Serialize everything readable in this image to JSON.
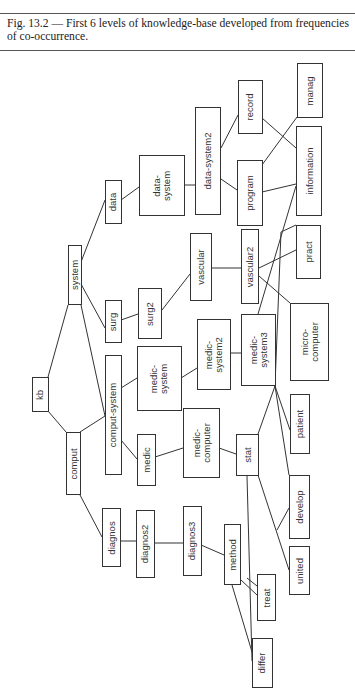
{
  "caption": {
    "text": "Fig. 13.2 — First 6 levels of knowledge-base developed from frequencies of co-occurrence."
  },
  "diagram": {
    "orientation": "rotated-90-ccw",
    "nodes": [
      {
        "id": "kb",
        "label": "kb",
        "x": 32,
        "y": 377,
        "w": 17,
        "h": 35
      },
      {
        "id": "comput",
        "label": "comput",
        "x": 66,
        "y": 432,
        "w": 15,
        "h": 63
      },
      {
        "id": "system",
        "label": "system",
        "x": 68,
        "y": 245,
        "w": 14,
        "h": 60
      },
      {
        "id": "data",
        "label": "data",
        "x": 105,
        "y": 180,
        "w": 17,
        "h": 44
      },
      {
        "id": "surg",
        "label": "surg",
        "x": 105,
        "y": 300,
        "w": 17,
        "h": 43
      },
      {
        "id": "comput-system",
        "label": "comput-system",
        "x": 105,
        "y": 355,
        "w": 17,
        "h": 120
      },
      {
        "id": "medic",
        "label": "medic",
        "x": 137,
        "y": 434,
        "w": 19,
        "h": 52
      },
      {
        "id": "diagnos",
        "label": "diagnos",
        "x": 102,
        "y": 508,
        "w": 19,
        "h": 59
      },
      {
        "id": "diagnos2",
        "label": "diagnos2",
        "x": 136,
        "y": 510,
        "w": 19,
        "h": 68
      },
      {
        "id": "diagnos3",
        "label": "diagnos3",
        "x": 183,
        "y": 506,
        "w": 19,
        "h": 70
      },
      {
        "id": "data-system",
        "label": "data-\nsystem",
        "x": 139,
        "y": 155,
        "w": 46,
        "h": 61
      },
      {
        "id": "surg2",
        "label": "surg2",
        "x": 138,
        "y": 288,
        "w": 24,
        "h": 51
      },
      {
        "id": "medic-system",
        "label": "medic-\nsystem",
        "x": 137,
        "y": 346,
        "w": 45,
        "h": 65
      },
      {
        "id": "medic-computer",
        "label": "medic-\ncomputer",
        "x": 183,
        "y": 408,
        "w": 37,
        "h": 70
      },
      {
        "id": "data-system2",
        "label": "data-system2",
        "x": 195,
        "y": 107,
        "w": 26,
        "h": 108
      },
      {
        "id": "vascular",
        "label": "vascular",
        "x": 190,
        "y": 233,
        "w": 22,
        "h": 68
      },
      {
        "id": "medic-system2",
        "label": "medic-\nsystem2",
        "x": 197,
        "y": 319,
        "w": 34,
        "h": 71
      },
      {
        "id": "record",
        "label": "record",
        "x": 238,
        "y": 80,
        "w": 25,
        "h": 54
      },
      {
        "id": "program",
        "label": "program",
        "x": 237,
        "y": 160,
        "w": 26,
        "h": 66
      },
      {
        "id": "vascular2",
        "label": "vascular2",
        "x": 241,
        "y": 229,
        "w": 18,
        "h": 75
      },
      {
        "id": "medic-system3",
        "label": "medic-\nsystem3",
        "x": 241,
        "y": 314,
        "w": 35,
        "h": 72
      },
      {
        "id": "stat",
        "label": "stat",
        "x": 236,
        "y": 434,
        "w": 23,
        "h": 42
      },
      {
        "id": "method",
        "label": "method",
        "x": 224,
        "y": 524,
        "w": 17,
        "h": 61
      },
      {
        "id": "treat",
        "label": "treat",
        "x": 257,
        "y": 574,
        "w": 19,
        "h": 47
      },
      {
        "id": "differ",
        "label": "differ",
        "x": 252,
        "y": 638,
        "w": 21,
        "h": 50
      },
      {
        "id": "manag",
        "label": "manag",
        "x": 297,
        "y": 63,
        "w": 26,
        "h": 55
      },
      {
        "id": "information",
        "label": "information",
        "x": 296,
        "y": 126,
        "w": 26,
        "h": 90
      },
      {
        "id": "pract",
        "label": "pract",
        "x": 296,
        "y": 225,
        "w": 25,
        "h": 54
      },
      {
        "id": "micro-computer",
        "label": "micro-\ncomputer",
        "x": 290,
        "y": 303,
        "w": 39,
        "h": 78
      },
      {
        "id": "patient",
        "label": "patient",
        "x": 290,
        "y": 394,
        "w": 20,
        "h": 60
      },
      {
        "id": "develop",
        "label": "develop",
        "x": 289,
        "y": 475,
        "w": 21,
        "h": 64
      },
      {
        "id": "united",
        "label": "united",
        "x": 289,
        "y": 546,
        "w": 21,
        "h": 49
      }
    ],
    "edges": [
      {
        "from": "kb",
        "to": "system",
        "points": [
          [
            48,
            377
          ],
          [
            68,
            305
          ]
        ]
      },
      {
        "from": "kb",
        "to": "comput",
        "points": [
          [
            48,
            411
          ],
          [
            66,
            432
          ]
        ]
      },
      {
        "from": "system",
        "to": "data",
        "points": [
          [
            81,
            262
          ],
          [
            105,
            200
          ]
        ]
      },
      {
        "from": "system",
        "to": "surg",
        "points": [
          [
            81,
            284
          ],
          [
            105,
            328
          ]
        ]
      },
      {
        "from": "system",
        "to": "comput-system",
        "points": [
          [
            81,
            305
          ],
          [
            105,
            416
          ]
        ]
      },
      {
        "from": "comput",
        "to": "comput-system",
        "points": [
          [
            80,
            432
          ],
          [
            105,
            416
          ]
        ]
      },
      {
        "from": "comput",
        "to": "diagnos",
        "points": [
          [
            80,
            495
          ],
          [
            102,
            537
          ]
        ]
      },
      {
        "from": "comput-system",
        "to": "medic-system",
        "points": [
          [
            121,
            388
          ],
          [
            137,
            378
          ]
        ]
      },
      {
        "from": "comput-system",
        "to": "medic",
        "points": [
          [
            121,
            440
          ],
          [
            137,
            459
          ]
        ]
      },
      {
        "from": "data",
        "to": "data-system",
        "points": [
          [
            121,
            200
          ],
          [
            139,
            187
          ]
        ]
      },
      {
        "from": "surg",
        "to": "surg2",
        "points": [
          [
            121,
            320
          ],
          [
            138,
            314
          ]
        ]
      },
      {
        "from": "medic",
        "to": "medic-computer",
        "points": [
          [
            155,
            457
          ],
          [
            183,
            448
          ]
        ]
      },
      {
        "from": "diagnos",
        "to": "diagnos2",
        "points": [
          [
            120,
            541
          ],
          [
            136,
            541
          ]
        ]
      },
      {
        "from": "diagnos2",
        "to": "diagnos3",
        "points": [
          [
            155,
            543
          ],
          [
            183,
            543
          ]
        ]
      },
      {
        "from": "diagnos3",
        "to": "method",
        "points": [
          [
            201,
            545
          ],
          [
            224,
            555
          ]
        ]
      },
      {
        "from": "data-system",
        "to": "data-system2",
        "points": [
          [
            185,
            185
          ],
          [
            195,
            185
          ]
        ]
      },
      {
        "from": "surg2",
        "to": "vascular",
        "points": [
          [
            162,
            310
          ],
          [
            190,
            274
          ]
        ]
      },
      {
        "from": "medic-system",
        "to": "medic-system2",
        "points": [
          [
            181,
            378
          ],
          [
            197,
            368
          ]
        ]
      },
      {
        "from": "medic-system2",
        "to": "medic-system3",
        "points": [
          [
            231,
            353
          ],
          [
            241,
            353
          ]
        ]
      },
      {
        "from": "medic-computer",
        "to": "stat",
        "points": [
          [
            219,
            448
          ],
          [
            236,
            454
          ]
        ]
      },
      {
        "from": "data-system2",
        "to": "record",
        "points": [
          [
            221,
            148
          ],
          [
            238,
            115
          ]
        ]
      },
      {
        "from": "data-system2",
        "to": "program",
        "points": [
          [
            221,
            179
          ],
          [
            237,
            190
          ]
        ]
      },
      {
        "from": "vascular",
        "to": "vascular2",
        "points": [
          [
            211,
            268
          ],
          [
            241,
            268
          ]
        ]
      },
      {
        "from": "record",
        "to": "information",
        "points": [
          [
            262,
            118
          ],
          [
            296,
            148
          ]
        ]
      },
      {
        "from": "program",
        "to": "manag",
        "points": [
          [
            262,
            165
          ],
          [
            297,
            117
          ]
        ]
      },
      {
        "from": "program",
        "to": "information",
        "points": [
          [
            262,
            192
          ],
          [
            296,
            184
          ]
        ]
      },
      {
        "from": "vascular2",
        "to": "pract",
        "points": [
          [
            259,
            268
          ],
          [
            296,
            250
          ]
        ]
      },
      {
        "from": "vascular2",
        "to": "micro-computer",
        "points": [
          [
            259,
            276
          ],
          [
            290,
            303
          ]
        ]
      },
      {
        "from": "medic-system3",
        "to": "information",
        "points": [
          [
            258,
            314
          ],
          [
            296,
            186
          ]
        ]
      },
      {
        "from": "medic-system3",
        "to": "patient",
        "points": [
          [
            275,
            386
          ],
          [
            290,
            430
          ]
        ]
      },
      {
        "from": "medic-system3",
        "to": "stat",
        "points": [
          [
            275,
            386
          ],
          [
            258,
            434
          ]
        ]
      },
      {
        "from": "medic-system3",
        "to": "develop",
        "points": [
          [
            275,
            386
          ],
          [
            289,
            475
          ]
        ]
      },
      {
        "from": "stat",
        "to": "information",
        "points": [
          [
            275,
            386
          ],
          [
            281,
            232
          ],
          [
            296,
            225
          ]
        ]
      },
      {
        "from": "stat",
        "to": "united",
        "points": [
          [
            258,
            475
          ],
          [
            289,
            570
          ]
        ]
      },
      {
        "from": "stat",
        "to": "develop",
        "points": [
          [
            277,
            530
          ],
          [
            289,
            508
          ]
        ]
      },
      {
        "from": "stat",
        "to": "differ",
        "points": [
          [
            247,
            476
          ],
          [
            252,
            661
          ]
        ]
      },
      {
        "from": "method",
        "to": "treat",
        "points": [
          [
            241,
            580
          ],
          [
            257,
            595
          ]
        ]
      },
      {
        "from": "method",
        "to": "treat",
        "points": [
          [
            247,
            578
          ],
          [
            257,
            586
          ]
        ]
      },
      {
        "from": "method",
        "to": "differ",
        "points": [
          [
            232,
            585
          ],
          [
            252,
            652
          ]
        ]
      }
    ]
  }
}
